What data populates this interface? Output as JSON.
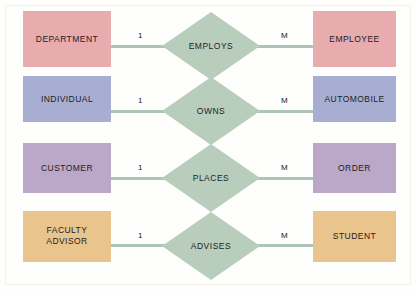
{
  "diagram": {
    "type": "er-diagram",
    "background_color": "#fefefd",
    "frame_color": "#f3f1ea",
    "connector_color": "#aec4b7",
    "relationship_fill": "#b9cdbd",
    "text_color": "#1d1d1d",
    "rows": [
      {
        "id": "employs",
        "left_entity": "DEPARTMENT",
        "left_color": "#e8abae",
        "left_cardinality": "1",
        "relationship": "EMPLOYS",
        "relationship_color": "#b9cdbd",
        "right_cardinality": "M",
        "right_entity": "EMPLOYEE",
        "right_color": "#e8abae"
      },
      {
        "id": "owns",
        "left_entity": "INDIVIDUAL",
        "left_color": "#a8aed2",
        "left_cardinality": "1",
        "relationship": "OWNS",
        "relationship_color": "#b9cdbd",
        "right_cardinality": "M",
        "right_entity": "AUTOMOBILE",
        "right_color": "#a8aed2"
      },
      {
        "id": "places",
        "left_entity": "CUSTOMER",
        "left_color": "#bba8c9",
        "left_cardinality": "1",
        "relationship": "PLACES",
        "relationship_color": "#b9cdbd",
        "right_cardinality": "M",
        "right_entity": "ORDER",
        "right_color": "#bba8c9"
      },
      {
        "id": "advises",
        "left_entity": "FACULTY\nADVISOR",
        "left_color": "#e9c48c",
        "left_cardinality": "1",
        "relationship": "ADVISES",
        "relationship_color": "#b9cdbd",
        "right_cardinality": "M",
        "right_entity": "STUDENT",
        "right_color": "#e9c48c"
      }
    ]
  }
}
